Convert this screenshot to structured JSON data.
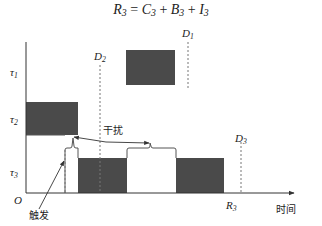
{
  "title": {
    "r": "R",
    "r_sub": "3",
    "eq": " = ",
    "c": "C",
    "c_sub": "3",
    "plus1": " + ",
    "b": "B",
    "b_sub": "3",
    "plus2": " + ",
    "i": "I",
    "i_sub": "3"
  },
  "axes": {
    "origin": "O",
    "x_label": "时间",
    "y_ticks": [
      {
        "sym": "τ",
        "sub": "1"
      },
      {
        "sym": "τ",
        "sub": "2"
      },
      {
        "sym": "τ",
        "sub": "3"
      }
    ]
  },
  "deadlines": [
    {
      "sym": "D",
      "sub": "1"
    },
    {
      "sym": "D",
      "sub": "2"
    },
    {
      "sym": "D",
      "sub": "3"
    }
  ],
  "response_marker": {
    "sym": "R",
    "sub": "3"
  },
  "annotations": {
    "interference": "干扰",
    "trigger": "触发"
  },
  "colors": {
    "block_fill": "#4a4a4a",
    "line": "#333333",
    "dashed": "#666666",
    "background": "#ffffff"
  }
}
